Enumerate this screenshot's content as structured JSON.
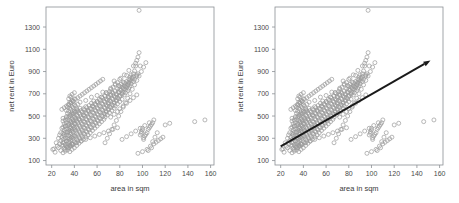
{
  "figure": {
    "panels": [
      {
        "id": "left",
        "name": "scatter-without-fit",
        "show_fit_line": false
      },
      {
        "id": "right",
        "name": "scatter-with-fit",
        "show_fit_line": true
      }
    ]
  },
  "chart_data": {
    "type": "scatter",
    "title": "",
    "xlabel": "area in sqm",
    "ylabel": "net rent in Euro",
    "xlim": [
      15,
      163
    ],
    "ylim": [
      60,
      1480
    ],
    "xticks": [
      20,
      40,
      60,
      80,
      100,
      120,
      140,
      160
    ],
    "yticks": [
      100,
      300,
      500,
      700,
      900,
      1100,
      1300
    ],
    "grid": false,
    "legend": null,
    "marker": {
      "shape": "open-circle",
      "radius_px": 2.0,
      "color": "#9a9a9a",
      "filled": false
    },
    "fit_line": {
      "type": "linear-regression",
      "color": "#1a1a1a",
      "has_arrowhead": true,
      "arrow_position": "end",
      "x_start": 20,
      "y_start": 228,
      "x_end": 152,
      "y_end": 1000,
      "slope": 5.85,
      "intercept": 111
    },
    "x": [
      21,
      22,
      23,
      24,
      25,
      26,
      26,
      27,
      27,
      28,
      28,
      28,
      29,
      29,
      29,
      30,
      30,
      30,
      30,
      30,
      30,
      31,
      31,
      31,
      31,
      31,
      32,
      32,
      32,
      32,
      32,
      32,
      33,
      33,
      33,
      33,
      33,
      33,
      33,
      34,
      34,
      34,
      34,
      34,
      34,
      34,
      34,
      35,
      35,
      35,
      35,
      35,
      35,
      35,
      35,
      35,
      36,
      36,
      36,
      36,
      36,
      36,
      36,
      36,
      36,
      36,
      37,
      37,
      37,
      37,
      37,
      37,
      37,
      37,
      37,
      38,
      38,
      38,
      38,
      38,
      38,
      38,
      38,
      38,
      38,
      39,
      39,
      39,
      39,
      39,
      39,
      39,
      39,
      40,
      40,
      40,
      40,
      40,
      40,
      40,
      40,
      40,
      40,
      41,
      41,
      41,
      41,
      41,
      41,
      41,
      42,
      42,
      42,
      42,
      42,
      42,
      42,
      43,
      43,
      43,
      43,
      43,
      43,
      43,
      44,
      44,
      44,
      44,
      44,
      44,
      45,
      45,
      45,
      45,
      45,
      45,
      45,
      46,
      46,
      46,
      46,
      46,
      46,
      47,
      47,
      47,
      47,
      47,
      48,
      48,
      48,
      48,
      48,
      48,
      49,
      49,
      49,
      49,
      49,
      50,
      50,
      50,
      50,
      50,
      50,
      50,
      51,
      51,
      51,
      51,
      51,
      52,
      52,
      52,
      52,
      52,
      53,
      53,
      53,
      53,
      53,
      54,
      54,
      54,
      54,
      54,
      55,
      55,
      55,
      55,
      55,
      55,
      56,
      56,
      56,
      56,
      56,
      57,
      57,
      57,
      57,
      57,
      58,
      58,
      58,
      58,
      58,
      59,
      59,
      59,
      59,
      60,
      60,
      60,
      60,
      60,
      60,
      61,
      61,
      61,
      61,
      62,
      62,
      62,
      62,
      62,
      63,
      63,
      63,
      63,
      64,
      64,
      64,
      64,
      64,
      65,
      65,
      65,
      65,
      65,
      66,
      66,
      66,
      66,
      67,
      67,
      67,
      67,
      67,
      68,
      68,
      68,
      68,
      68,
      69,
      69,
      69,
      69,
      70,
      70,
      70,
      70,
      70,
      70,
      71,
      71,
      71,
      71,
      72,
      72,
      72,
      72,
      72,
      73,
      73,
      73,
      73,
      74,
      74,
      74,
      74,
      75,
      75,
      75,
      75,
      75,
      76,
      76,
      76,
      76,
      77,
      77,
      77,
      77,
      78,
      78,
      78,
      78,
      79,
      79,
      79,
      79,
      80,
      80,
      80,
      80,
      80,
      81,
      81,
      81,
      82,
      82,
      82,
      82,
      83,
      83,
      83,
      84,
      84,
      84,
      84,
      85,
      85,
      85,
      85,
      86,
      86,
      86,
      87,
      87,
      87,
      88,
      88,
      88,
      88,
      89,
      89,
      89,
      90,
      90,
      90,
      91,
      91,
      92,
      92,
      92,
      93,
      93,
      94,
      94,
      95,
      95,
      95,
      96,
      96,
      97,
      97,
      98,
      98,
      99,
      99,
      100,
      100,
      101,
      101,
      102,
      103,
      104,
      105,
      106,
      107,
      108,
      109,
      110,
      112,
      114,
      116,
      118,
      120,
      124,
      146,
      155,
      30,
      32,
      34,
      36,
      38,
      30,
      33,
      35,
      37,
      39,
      31,
      34,
      36,
      38,
      40,
      32,
      35,
      37,
      39,
      41,
      33,
      36,
      38,
      40,
      42,
      29,
      31,
      33,
      35,
      37,
      39,
      41,
      43,
      45,
      47,
      49,
      51,
      53,
      55,
      57,
      59,
      61,
      63,
      65,
      67,
      69,
      71,
      73,
      75,
      77,
      79,
      81,
      83,
      85,
      87,
      89,
      91,
      93,
      95,
      97,
      99,
      101,
      103,
      105,
      107,
      109,
      111,
      113,
      36,
      40,
      44,
      48,
      52,
      56,
      60,
      64,
      68,
      72,
      76,
      80,
      84,
      88,
      92,
      96,
      100,
      104,
      108,
      34,
      38,
      42,
      46,
      50,
      54,
      58,
      62,
      66,
      70,
      74,
      78,
      82,
      86,
      90,
      94,
      98,
      102,
      106,
      110,
      72,
      75,
      78,
      80,
      83,
      86,
      89,
      92,
      95,
      98,
      101,
      104,
      107,
      110,
      113,
      116,
      64,
      67,
      70,
      73,
      76,
      79,
      82,
      85,
      88,
      91,
      94,
      97,
      100,
      103,
      106,
      109,
      112
    ],
    "y": [
      200,
      205,
      175,
      260,
      230,
      215,
      300,
      250,
      330,
      190,
      280,
      350,
      240,
      310,
      390,
      170,
      230,
      290,
      345,
      400,
      455,
      210,
      265,
      320,
      375,
      430,
      185,
      245,
      300,
      355,
      410,
      465,
      225,
      275,
      330,
      385,
      440,
      495,
      550,
      195,
      250,
      305,
      360,
      415,
      470,
      525,
      580,
      215,
      270,
      325,
      380,
      435,
      490,
      545,
      600,
      655,
      180,
      240,
      295,
      350,
      405,
      460,
      515,
      570,
      625,
      680,
      230,
      285,
      340,
      395,
      450,
      505,
      560,
      615,
      670,
      200,
      255,
      310,
      365,
      420,
      475,
      530,
      585,
      640,
      695,
      245,
      300,
      355,
      410,
      465,
      520,
      575,
      630,
      215,
      270,
      325,
      380,
      435,
      490,
      545,
      600,
      655,
      710,
      260,
      315,
      370,
      425,
      480,
      535,
      590,
      235,
      290,
      345,
      400,
      455,
      510,
      565,
      275,
      330,
      385,
      440,
      495,
      550,
      605,
      255,
      310,
      365,
      420,
      475,
      530,
      295,
      350,
      405,
      460,
      515,
      570,
      625,
      275,
      330,
      385,
      440,
      495,
      550,
      315,
      370,
      425,
      480,
      535,
      290,
      345,
      400,
      455,
      510,
      565,
      335,
      390,
      445,
      500,
      555,
      310,
      365,
      420,
      475,
      530,
      585,
      640,
      355,
      410,
      465,
      520,
      575,
      330,
      385,
      440,
      495,
      550,
      375,
      430,
      485,
      540,
      595,
      350,
      405,
      460,
      515,
      570,
      395,
      450,
      505,
      560,
      615,
      670,
      370,
      425,
      480,
      535,
      590,
      415,
      470,
      525,
      580,
      635,
      390,
      445,
      500,
      555,
      610,
      435,
      490,
      545,
      600,
      410,
      465,
      520,
      575,
      630,
      685,
      455,
      510,
      565,
      620,
      430,
      485,
      540,
      595,
      650,
      475,
      530,
      585,
      640,
      450,
      505,
      560,
      615,
      670,
      495,
      550,
      605,
      660,
      715,
      470,
      525,
      580,
      635,
      515,
      570,
      625,
      680,
      490,
      545,
      600,
      655,
      710,
      535,
      590,
      645,
      700,
      510,
      565,
      620,
      675,
      555,
      610,
      665,
      720,
      530,
      585,
      640,
      695,
      575,
      630,
      685,
      740,
      550,
      605,
      660,
      715,
      595,
      650,
      705,
      760,
      815,
      570,
      625,
      680,
      615,
      670,
      725,
      780,
      590,
      645,
      700,
      635,
      690,
      745,
      800,
      610,
      665,
      720,
      775,
      655,
      710,
      765,
      630,
      685,
      740,
      675,
      730,
      785,
      840,
      650,
      705,
      760,
      695,
      750,
      805,
      715,
      770,
      690,
      745,
      800,
      735,
      790,
      710,
      765,
      755,
      810,
      865,
      730,
      785,
      775,
      830,
      750,
      805,
      795,
      850,
      770,
      825,
      815,
      870,
      790,
      845,
      835,
      810,
      855,
      880,
      905,
      830,
      950,
      975,
      860,
      1000,
      870,
      1030,
      880,
      1070,
      1450,
      950,
      330,
      345,
      360,
      375,
      390,
      290,
      305,
      320,
      335,
      350,
      380,
      395,
      410,
      425,
      440,
      250,
      265,
      280,
      295,
      310,
      420,
      435,
      450,
      465,
      480,
      200,
      215,
      230,
      245,
      260,
      275,
      290,
      305,
      320,
      335,
      350,
      365,
      380,
      395,
      410,
      425,
      440,
      455,
      470,
      485,
      500,
      515,
      530,
      545,
      560,
      575,
      590,
      605,
      620,
      635,
      650,
      665,
      680,
      695,
      710,
      725,
      740,
      755,
      770,
      785,
      800,
      815,
      830,
      260,
      300,
      340,
      380,
      420,
      460,
      500,
      540,
      580,
      620,
      660,
      700,
      740,
      780,
      820,
      860,
      900,
      940,
      980,
      190,
      230,
      270,
      310,
      350,
      390,
      430,
      470,
      510,
      550,
      590,
      630,
      670,
      710,
      750,
      790,
      830,
      870,
      910,
      950,
      165,
      180,
      200,
      215,
      230,
      245,
      260,
      275,
      290,
      305,
      320,
      335,
      350,
      365,
      380,
      395,
      290,
      315,
      340,
      365,
      390,
      415,
      440,
      465,
      490,
      515,
      540,
      565,
      590,
      615,
      640,
      665,
      690
    ]
  }
}
